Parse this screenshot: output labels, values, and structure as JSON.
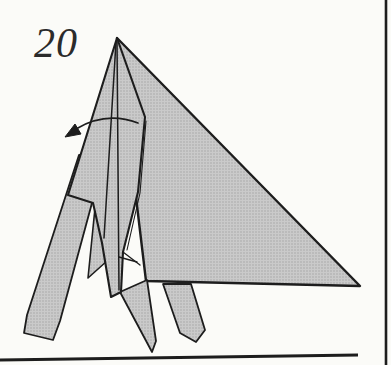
{
  "page": {
    "step_label": "20",
    "background": "#fbfbf8"
  },
  "diagram": {
    "type": "origami-instruction-step",
    "fill_gray": "#c4c4c4",
    "stroke_color": "#1d1d1d",
    "shapes": [
      {
        "name": "rear-wing-triangle",
        "points": "117,38 360,286 146,281",
        "stroke_width": 2.4
      },
      {
        "name": "right-leg",
        "points": "163,284 191,284 205,330 196,342 180,333",
        "stroke_width": 1.8
      },
      {
        "name": "middle-leg",
        "points": "120,292 147,280 156,341 152,352",
        "stroke_width": 1.8
      },
      {
        "name": "inner-flap",
        "points": "97,188 120,226 117,252 88,278",
        "stroke_width": 1.6
      },
      {
        "name": "left-leg",
        "points": "79,155 105,155 60,321 53,340 24,333 27,315",
        "stroke_width": 1.8
      },
      {
        "name": "front-flap",
        "points": "117,38 145,117 138,192 123,252 121,292 111,297 102,243 93,203 68,195",
        "stroke_width": 2.1
      }
    ],
    "fold_lines": [
      {
        "name": "crease-left",
        "points": "116,42 104,238",
        "stroke_width": 1.5
      },
      {
        "name": "crease-center",
        "points": "117,42 119,290",
        "stroke_width": 1.5
      },
      {
        "name": "layer-edge-double",
        "points": "146,121 140,193 127,250",
        "stroke_width": 1.1
      },
      {
        "name": "fold-detail-1",
        "points": "123,252 140,265",
        "stroke_width": 1.3
      },
      {
        "name": "fold-detail-2",
        "points": "119,257 137,262",
        "stroke_width": 1.3
      }
    ],
    "arrow": {
      "name": "fold-direction-arrow",
      "path": "M138,123 Q106,111 76,129",
      "head_points": "65,137 75,124 81,134",
      "stroke_width": 1.7
    }
  },
  "frame": {
    "right_border": {
      "x1": 386,
      "y1": 0,
      "x2": 386,
      "y2": 365,
      "stroke_width": 2.6
    },
    "bottom_rule": {
      "x1": 0,
      "y1": 360,
      "x2": 358,
      "y2": 355,
      "stroke_width": 3
    }
  }
}
